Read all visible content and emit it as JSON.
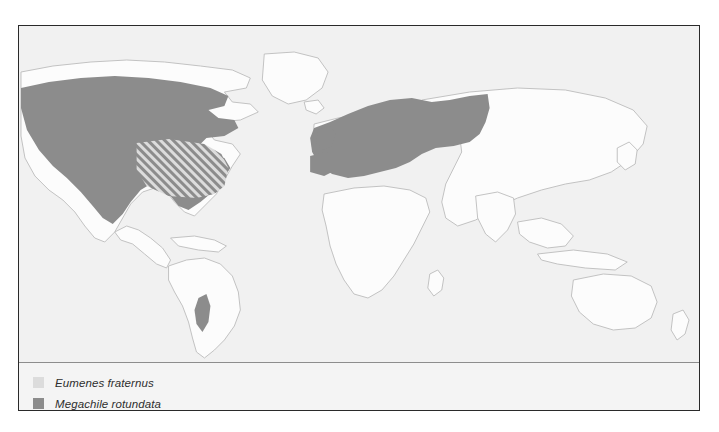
{
  "figure": {
    "type": "distribution-map",
    "projection": "world",
    "background_color": "#f1f1f1",
    "land_fill": "#fcfcfc",
    "coastline_color": "#b9b9b9",
    "border_color": "#2a2a2a"
  },
  "legend": {
    "divider_color": "#8d8d8d",
    "entries": [
      {
        "label": "Eumenes fraternus",
        "swatch_color": "#dcdcdc",
        "pattern": "solid",
        "swatch_name": "legend-swatch-eumenes"
      },
      {
        "label": "Megachile rotundata",
        "swatch_color": "#8c8c8c",
        "pattern": "solid",
        "swatch_name": "legend-swatch-megachile"
      }
    ]
  },
  "ranges": {
    "megachile_fill": "#8c8c8c",
    "eumenes_fill": "#dcdcdc",
    "overlap_pattern": "diagonal-hatch",
    "regions": [
      {
        "name": "north-america",
        "species": "Megachile rotundata"
      },
      {
        "name": "eastern-united-states-overlap",
        "species": "Eumenes fraternus and Megachile rotundata"
      },
      {
        "name": "europe",
        "species": "Megachile rotundata"
      },
      {
        "name": "western-russia",
        "species": "Megachile rotundata"
      },
      {
        "name": "central-chile",
        "species": "Megachile rotundata"
      }
    ]
  }
}
